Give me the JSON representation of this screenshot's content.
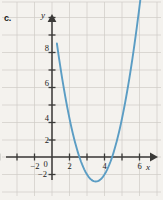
{
  "figure": {
    "part_label": "c.",
    "background_color": "#f4f2ee",
    "grid_color": "#cfccc6",
    "axis_color": "#3b3a38",
    "curve_color": "#5b9dc4"
  },
  "axes": {
    "x_name": "x",
    "y_name": "y",
    "origin_label": "0"
  },
  "chart_data": {
    "type": "line",
    "title": "",
    "subtitle": "",
    "xlabel": "x",
    "ylabel": "y",
    "grid": true,
    "legend": null,
    "xlim": [
      -3.5,
      7.2
    ],
    "ylim": [
      -2.8,
      10.8
    ],
    "x_ticks": [
      -3,
      -2,
      -1,
      0,
      1,
      2,
      3,
      4,
      5,
      6,
      7
    ],
    "y_ticks": [
      -2,
      -1,
      1,
      2,
      3,
      4,
      5,
      6,
      7,
      8,
      9,
      10
    ],
    "x_tick_labels": [
      {
        "value": -2,
        "text": "−2"
      },
      {
        "value": 0,
        "text": "0"
      },
      {
        "value": 2,
        "text": "2"
      },
      {
        "value": 4,
        "text": "4"
      },
      {
        "value": 6,
        "text": "6"
      }
    ],
    "y_tick_labels": [
      {
        "value": -2,
        "text": "−2"
      },
      {
        "value": 2,
        "text": "2"
      },
      {
        "value": 4,
        "text": "4"
      },
      {
        "value": 6,
        "text": "6"
      },
      {
        "value": 8,
        "text": "8"
      }
    ],
    "series": [
      {
        "name": "parabola",
        "color": "#5b9dc4",
        "equation": "y = 1.6(x − 2.5)² − 1.4",
        "vertex": [
          2.5,
          -1.4
        ],
        "y_intercept": 5.0,
        "x_intercepts": [
          1.56,
          3.44
        ],
        "x": [
          0.3,
          0.6,
          0.9,
          1.2,
          1.5,
          1.8,
          2.1,
          2.4,
          2.7,
          3.0,
          3.3,
          3.6,
          3.9,
          4.2,
          4.5,
          4.8,
          5.1,
          5.4,
          5.7,
          6.0,
          6.3
        ],
        "y": [
          6.34,
          4.38,
          2.7,
          1.3,
          0.2,
          -0.62,
          -1.14,
          -1.38,
          -1.34,
          -1.0,
          -0.38,
          0.54,
          1.74,
          3.24,
          5.0,
          7.06,
          9.42,
          12.06,
          15.0,
          18.22,
          21.74
        ]
      }
    ]
  }
}
